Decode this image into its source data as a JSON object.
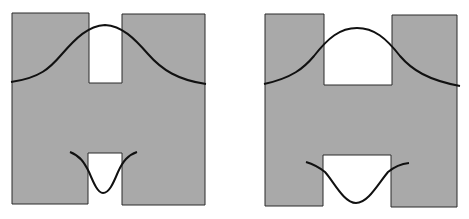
{
  "colors": {
    "background": "#ffffff",
    "fill": "#a9a9a9",
    "stroke": "#222222",
    "curve": "#111111"
  },
  "figures": [
    {
      "name": "narrow-gap-figure",
      "shape": "H-shaped waveguide with narrow notches",
      "top_curve": "gaussian profile peaking within top notch",
      "bottom_curve": "narrow inverted profile dipping into bottom notch"
    },
    {
      "name": "wide-gap-figure",
      "shape": "H-shaped waveguide with wide notches",
      "top_curve": "broader gaussian profile peaking within top notch",
      "bottom_curve": "wider inverted profile dipping into bottom notch"
    }
  ]
}
